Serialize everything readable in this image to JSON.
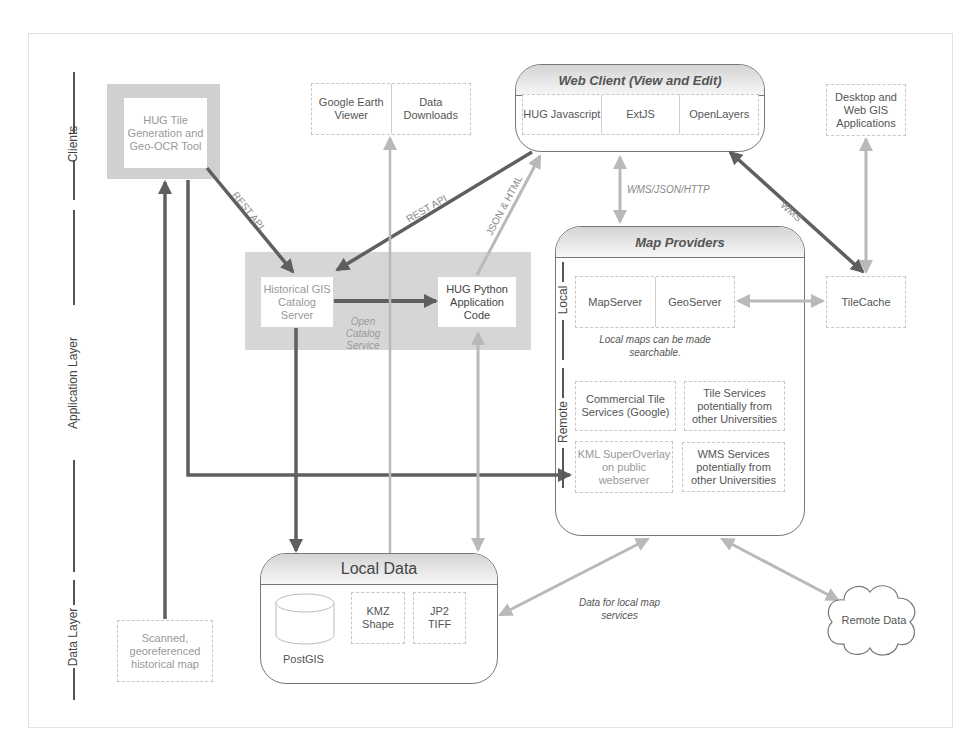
{
  "layers": {
    "clients": "Clients",
    "application": "Application Layer",
    "data": "Data Layer"
  },
  "clients": {
    "hug_tile_tool": "HUG Tile Generation and Geo-OCR Tool",
    "google_earth": "Google Earth Viewer",
    "data_downloads": "Data Downloads",
    "desktop_gis": "Desktop and Web GIS Applications"
  },
  "web_client": {
    "title": "Web Client (View and Edit)",
    "items": [
      "HUG Javascript",
      "ExtJS",
      "OpenLayers"
    ]
  },
  "application": {
    "catalog_server": "Historical GIS Catalog Server",
    "open_catalog_service": "Open Catalog Service",
    "python_code": "HUG Python Application Code",
    "tilecache": "TileCache"
  },
  "map_providers": {
    "title": "Map Providers",
    "local_label": "Local",
    "remote_label": "Remote",
    "local_items": [
      "MapServer",
      "GeoServer"
    ],
    "local_note": "Local maps can be made searchable.",
    "remote_items": [
      "Commercial Tile Services (Google)",
      "Tile Services potentially from other Universities",
      "KML SuperOverlay on public webserver",
      "WMS Services potentially from other Universities"
    ]
  },
  "local_data": {
    "title": "Local Data",
    "postgis": "PostGIS",
    "kmz": "KMZ Shape",
    "jp2": "JP2 TIFF"
  },
  "data_layer": {
    "scanned_map": "Scanned, georeferenced historical map",
    "remote_data": "Remote Data",
    "data_note": "Data for local map services"
  },
  "edge_labels": {
    "rest_api_left": "REST API",
    "rest_api_right": "REST API",
    "json_html": "JSON & HTML",
    "wms_json_http": "WMS/JSON/HTTP",
    "wms": "WMS"
  },
  "colors": {
    "dark_arrow": "#5f5f5f",
    "light_arrow": "#b9b9b9",
    "app_band": "#d6d6d6"
  }
}
